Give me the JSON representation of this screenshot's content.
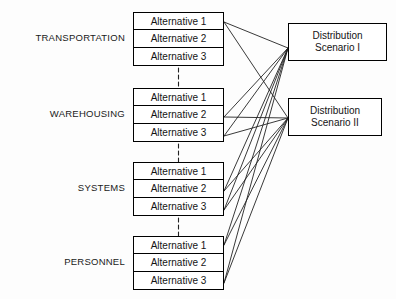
{
  "diagram": {
    "type": "node-link-diagram",
    "line_color": "#222222",
    "box_border_color": "#000000",
    "background_color": "#fdfdfd",
    "categories": [
      {
        "label": "TRANSPORTATION",
        "alternatives": [
          "Alternative 1",
          "Alternative 2",
          "Alternative 3"
        ]
      },
      {
        "label": "WAREHOUSING",
        "alternatives": [
          "Alternative 1",
          "Alternative 2",
          "Alternative 3"
        ]
      },
      {
        "label": "SYSTEMS",
        "alternatives": [
          "Alternative 1",
          "Alternative 2",
          "Alternative 3"
        ]
      },
      {
        "label": "PERSONNEL",
        "alternatives": [
          "Alternative 1",
          "Alternative 2",
          "Alternative 3"
        ]
      }
    ],
    "scenarios": [
      {
        "label": "Distribution\nScenario I"
      },
      {
        "label": "Distribution\nScenario II"
      }
    ]
  }
}
